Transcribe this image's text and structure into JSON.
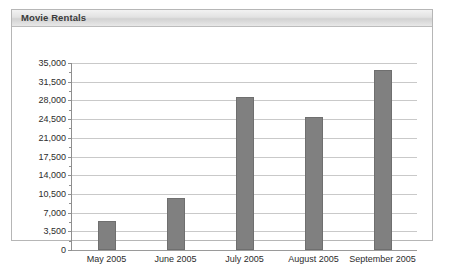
{
  "panel": {
    "title": "Movie Rentals"
  },
  "chart_data": {
    "type": "bar",
    "title": "Movie Rentals",
    "xlabel": "",
    "ylabel": "",
    "categories": [
      "May 2005",
      "June 2005",
      "July 2005",
      "August 2005",
      "September 2005"
    ],
    "values": [
      5400,
      9700,
      28700,
      24900,
      33700
    ],
    "ylim": [
      0,
      35000
    ],
    "ytick_step": 3500,
    "ytick_labels": [
      "0",
      "3,500",
      "7,000",
      "10,500",
      "14,000",
      "17,500",
      "21,000",
      "24,500",
      "28,000",
      "31,500",
      "35,000"
    ],
    "ytick_values": [
      0,
      3500,
      7000,
      10500,
      14000,
      17500,
      21000,
      24500,
      28000,
      31500,
      35000
    ],
    "grid": true,
    "legend": false,
    "bar_color": "#808080",
    "gridline_color": "#c9c9c9",
    "axis_color": "#8f8f8f"
  }
}
